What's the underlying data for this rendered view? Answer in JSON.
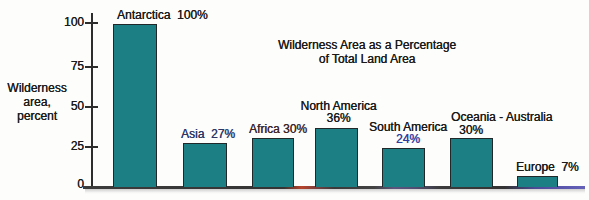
{
  "chart_data": {
    "type": "bar",
    "title": "Wilderness Area as a Percentage of Total Land Area",
    "title_lines": [
      "Wilderness Area as a Percentage",
      "of Total Land Area"
    ],
    "ylabel": "Wilderness area, percent",
    "ylabel_lines": [
      "Wilderness",
      "area,",
      "percent"
    ],
    "ylim": [
      0,
      100
    ],
    "yticks": [
      100,
      75,
      50,
      25,
      0
    ],
    "ytick_labels": [
      "100",
      "75",
      "50",
      "25",
      "0"
    ],
    "grid": false,
    "legend": false,
    "categories": [
      "Antarctica",
      "Asia",
      "Africa",
      "North America",
      "South America",
      "Oceania - Australia",
      "Europe"
    ],
    "values": [
      100,
      27,
      30,
      36,
      24,
      30,
      7
    ],
    "colors": {
      "bar_fill": "#1b7f84",
      "bar_border": "#20282a",
      "axis": "#2d2d2d",
      "text": "#1a1a1a",
      "baseline_fringe_red": "#b8432a",
      "baseline_fringe_purple": "#5c567e",
      "baseline_fringe_blue": "#5b57ae"
    },
    "bars": [
      {
        "category": "Antarctica",
        "value": 100,
        "line1": "Antarctica  100%",
        "line1_color": "#1a1a1a"
      },
      {
        "category": "Asia",
        "value": 27,
        "line1": "Asia  27%",
        "line1_color": "#2c3768"
      },
      {
        "category": "Africa",
        "value": 30,
        "line1": "Africa 30%",
        "line1_color": "#3e262b"
      },
      {
        "category": "North America",
        "value": 36,
        "line1": "North America",
        "line2": "36%",
        "line1_color": "#1a1a1a",
        "line2_color": "#1a1a1a"
      },
      {
        "category": "South America",
        "value": 24,
        "line1": "South America",
        "line2": "24%",
        "line1_color": "#1a1a1a",
        "line2_color": "#2f3da0"
      },
      {
        "category": "Oceania - Australia",
        "value": 30,
        "line1": "Oceania - Australia",
        "line2": "30%",
        "line1_color": "#1a1a1a",
        "line2_color": "#1a1a1a"
      },
      {
        "category": "Europe",
        "value": 7,
        "line1": "Europe  7%",
        "line1_color": "#1a1a1a"
      }
    ]
  }
}
